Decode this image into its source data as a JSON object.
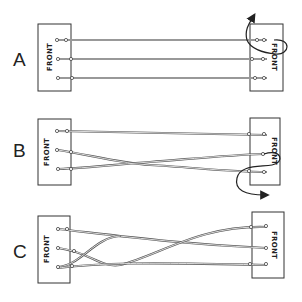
{
  "diagram": {
    "box_text": "FRONT",
    "panels": [
      {
        "id": "A",
        "label": "A",
        "description": "Three parallel wires; right board flipped over (rotation arrow)"
      },
      {
        "id": "B",
        "label": "B",
        "description": "Bottom two wires crossed once; right board flipped downward (rotation arrow)"
      },
      {
        "id": "C",
        "label": "C",
        "description": "Wires twisted into braid; right board shown in final position"
      }
    ],
    "colors": {
      "line": "#333333",
      "wire": "#555555",
      "background": "#ffffff"
    }
  }
}
